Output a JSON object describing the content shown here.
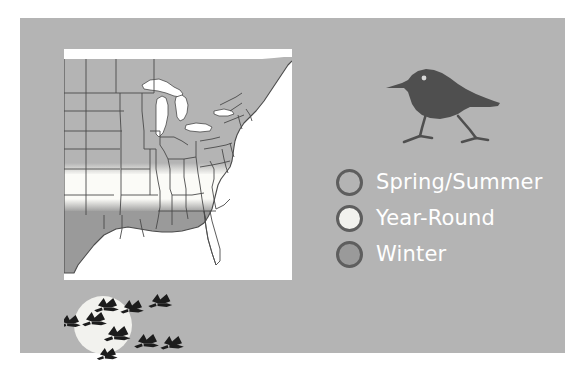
{
  "figure": {
    "panel_color": "#b4b4b4",
    "page_background": "#ffffff"
  },
  "map": {
    "name": "bird-migration-range-map",
    "region": "Eastern and Central United States",
    "water_color": "#ffffff",
    "border_color": "#4a4a4a",
    "ranges": {
      "spring_summer_color": "#b4b4b4",
      "year_round_color": "#fbfbf7",
      "winter_color": "#9a9a9a"
    }
  },
  "bird": {
    "name": "sandpiper-silhouette",
    "body_color": "#4f4f4f",
    "eye_color": "#d8d8d8"
  },
  "geese": {
    "name": "migrating-geese-over-moon",
    "moon_color": "#f2f2ee",
    "bird_color": "#1c1c1c",
    "count": 9
  },
  "legend": {
    "items": [
      {
        "label": "Spring/Summer",
        "swatch": "spring-summer-swatch",
        "color": "#b4b4b4"
      },
      {
        "label": "Year-Round",
        "swatch": "year-round-swatch",
        "color": "#f2f2ee"
      },
      {
        "label": "Winter",
        "swatch": "winter-swatch",
        "color": "#9a9a9a"
      }
    ],
    "text_color": "#ffffff",
    "ring_color": "#5e5e5e"
  }
}
